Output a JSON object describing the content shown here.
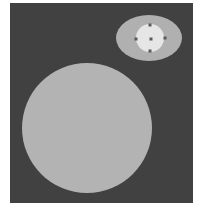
{
  "scene": {
    "background_color": "#414141",
    "page_color": "#ffffff",
    "large_circle": {
      "cx": 77,
      "cy": 125,
      "r": 65,
      "fill": "#b3b3b3"
    },
    "outer_ellipse": {
      "cx": 139,
      "cy": 35,
      "rx": 33,
      "ry": 23,
      "fill": "#b0b0b0"
    },
    "inner_circle": {
      "cx": 140,
      "cy": 35,
      "r": 14,
      "fill": "#e6e6e6"
    },
    "handles": [
      {
        "name": "handle-top",
        "cx": 140,
        "cy": 22
      },
      {
        "name": "handle-left",
        "cx": 126,
        "cy": 36
      },
      {
        "name": "handle-right",
        "cx": 155,
        "cy": 35
      },
      {
        "name": "handle-bottom",
        "cx": 140,
        "cy": 48
      },
      {
        "name": "handle-center",
        "cx": 141,
        "cy": 36
      }
    ],
    "handle_color": "#5a5a5a"
  }
}
